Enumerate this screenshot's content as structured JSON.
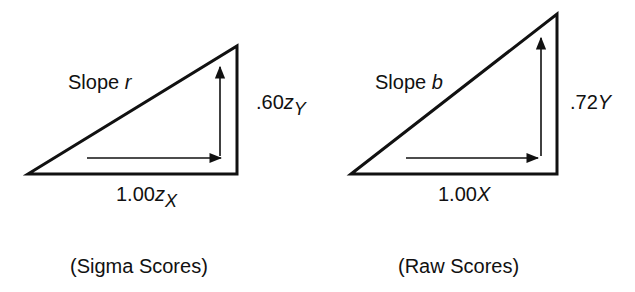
{
  "panels": [
    {
      "slope_prefix": "Slope ",
      "slope_symbol": "r",
      "rise_value": ".60",
      "rise_var": "z",
      "rise_sub": "Y",
      "run_value": "1.00",
      "run_var": "z",
      "run_sub": "X",
      "caption": "(Sigma Scores)"
    },
    {
      "slope_prefix": "Slope ",
      "slope_symbol": "b",
      "rise_value": ".72",
      "rise_var": "Y",
      "run_value": "1.00",
      "run_var": "X",
      "caption": "(Raw Scores)"
    }
  ],
  "colors": {
    "stroke": "#111111",
    "background": "#ffffff"
  }
}
